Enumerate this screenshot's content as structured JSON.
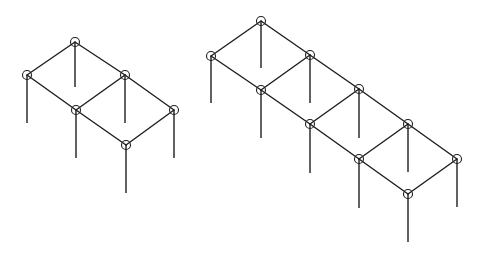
{
  "diagram": {
    "type": "isometric-frame-structures",
    "background": "#ffffff",
    "stroke_color": "#1e1e1e",
    "node_radius": 4.5,
    "structures": [
      {
        "name": "frame-2-bay",
        "nodes": [
          {
            "id": "L1",
            "x": 75,
            "y": 42,
            "column_bottom": 87
          },
          {
            "id": "L2",
            "x": 27,
            "y": 75,
            "column_bottom": 123
          },
          {
            "id": "L3",
            "x": 125,
            "y": 75,
            "column_bottom": 123
          },
          {
            "id": "L4",
            "x": 76,
            "y": 110,
            "column_bottom": 158
          },
          {
            "id": "L5",
            "x": 174,
            "y": 110,
            "column_bottom": 158
          },
          {
            "id": "L6",
            "x": 126,
            "y": 145,
            "column_bottom": 193
          }
        ],
        "beams": [
          [
            "L1",
            "L2"
          ],
          [
            "L1",
            "L3"
          ],
          [
            "L2",
            "L4"
          ],
          [
            "L3",
            "L4"
          ],
          [
            "L3",
            "L5"
          ],
          [
            "L4",
            "L6"
          ],
          [
            "L5",
            "L6"
          ]
        ]
      },
      {
        "name": "frame-4-bay",
        "nodes": [
          {
            "id": "R1",
            "x": 261,
            "y": 21,
            "column_bottom": 68
          },
          {
            "id": "R2",
            "x": 211,
            "y": 56,
            "column_bottom": 103
          },
          {
            "id": "R3",
            "x": 310,
            "y": 55,
            "column_bottom": 103
          },
          {
            "id": "R4",
            "x": 261,
            "y": 90,
            "column_bottom": 138
          },
          {
            "id": "R5",
            "x": 359,
            "y": 89,
            "column_bottom": 138
          },
          {
            "id": "R6",
            "x": 310,
            "y": 124,
            "column_bottom": 173
          },
          {
            "id": "R7",
            "x": 408,
            "y": 124,
            "column_bottom": 172
          },
          {
            "id": "R8",
            "x": 359,
            "y": 159,
            "column_bottom": 208
          },
          {
            "id": "R9",
            "x": 457,
            "y": 159,
            "column_bottom": 207
          },
          {
            "id": "R10",
            "x": 408,
            "y": 194,
            "column_bottom": 242
          }
        ],
        "beams": [
          [
            "R1",
            "R2"
          ],
          [
            "R1",
            "R3"
          ],
          [
            "R2",
            "R4"
          ],
          [
            "R3",
            "R4"
          ],
          [
            "R3",
            "R5"
          ],
          [
            "R4",
            "R6"
          ],
          [
            "R5",
            "R6"
          ],
          [
            "R5",
            "R7"
          ],
          [
            "R6",
            "R8"
          ],
          [
            "R7",
            "R8"
          ],
          [
            "R7",
            "R9"
          ],
          [
            "R8",
            "R10"
          ],
          [
            "R9",
            "R10"
          ]
        ]
      }
    ]
  }
}
